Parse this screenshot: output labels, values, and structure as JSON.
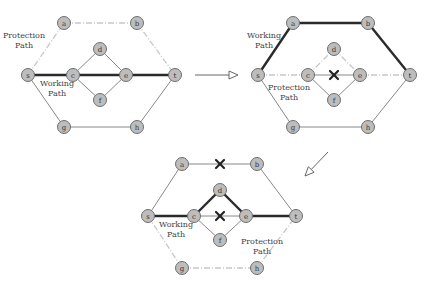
{
  "diagrams": [
    {
      "id": "initial",
      "nodes": [
        {
          "id": "a",
          "label": "a",
          "x": 64,
          "y": 23
        },
        {
          "id": "b",
          "label": "b",
          "x": 137,
          "y": 23
        },
        {
          "id": "s",
          "label": "s",
          "x": 28,
          "y": 75
        },
        {
          "id": "c",
          "label": "c",
          "x": 73,
          "y": 75
        },
        {
          "id": "d",
          "label": "d",
          "x": 100,
          "y": 49
        },
        {
          "id": "e",
          "label": "e",
          "x": 126,
          "y": 75
        },
        {
          "id": "f",
          "label": "f",
          "x": 100,
          "y": 100
        },
        {
          "id": "t",
          "label": "t",
          "x": 175,
          "y": 75
        },
        {
          "id": "g",
          "label": "g",
          "x": 64,
          "y": 127
        },
        {
          "id": "h",
          "label": "h",
          "x": 137,
          "y": 127
        }
      ],
      "edges": [
        {
          "from": "s",
          "to": "a",
          "type": "protect"
        },
        {
          "from": "a",
          "to": "b",
          "type": "protect"
        },
        {
          "from": "b",
          "to": "t",
          "type": "protect"
        },
        {
          "from": "s",
          "to": "c",
          "type": "working"
        },
        {
          "from": "c",
          "to": "e",
          "type": "working"
        },
        {
          "from": "e",
          "to": "t",
          "type": "working"
        },
        {
          "from": "c",
          "to": "d",
          "type": "normal"
        },
        {
          "from": "d",
          "to": "e",
          "type": "normal"
        },
        {
          "from": "c",
          "to": "f",
          "type": "normal"
        },
        {
          "from": "f",
          "to": "e",
          "type": "normal"
        },
        {
          "from": "s",
          "to": "g",
          "type": "normal"
        },
        {
          "from": "g",
          "to": "h",
          "type": "normal"
        },
        {
          "from": "h",
          "to": "t",
          "type": "normal"
        }
      ],
      "failures": [],
      "labels": [
        {
          "lines": [
            "Protection",
            "Path"
          ],
          "x": 24,
          "y": 38
        },
        {
          "lines": [
            "Working",
            "Path"
          ],
          "x": 57,
          "y": 86
        }
      ]
    },
    {
      "id": "after-first-failure",
      "nodes": [
        {
          "id": "a",
          "label": "a",
          "x": 293,
          "y": 23
        },
        {
          "id": "b",
          "label": "b",
          "x": 368,
          "y": 23
        },
        {
          "id": "s",
          "label": "s",
          "x": 258,
          "y": 75
        },
        {
          "id": "c",
          "label": "c",
          "x": 308,
          "y": 75
        },
        {
          "id": "d",
          "label": "d",
          "x": 334,
          "y": 49
        },
        {
          "id": "e",
          "label": "e",
          "x": 360,
          "y": 75
        },
        {
          "id": "f",
          "label": "f",
          "x": 334,
          "y": 100
        },
        {
          "id": "t",
          "label": "t",
          "x": 410,
          "y": 75
        },
        {
          "id": "g",
          "label": "g",
          "x": 293,
          "y": 127
        },
        {
          "id": "h",
          "label": "h",
          "x": 368,
          "y": 127
        }
      ],
      "edges": [
        {
          "from": "s",
          "to": "a",
          "type": "working"
        },
        {
          "from": "a",
          "to": "b",
          "type": "working"
        },
        {
          "from": "b",
          "to": "t",
          "type": "working"
        },
        {
          "from": "s",
          "to": "c",
          "type": "protect"
        },
        {
          "from": "c",
          "to": "e",
          "type": "normal"
        },
        {
          "from": "e",
          "to": "t",
          "type": "protect"
        },
        {
          "from": "c",
          "to": "d",
          "type": "protect"
        },
        {
          "from": "d",
          "to": "e",
          "type": "protect"
        },
        {
          "from": "c",
          "to": "f",
          "type": "normal"
        },
        {
          "from": "f",
          "to": "e",
          "type": "normal"
        },
        {
          "from": "s",
          "to": "g",
          "type": "normal"
        },
        {
          "from": "g",
          "to": "h",
          "type": "normal"
        },
        {
          "from": "h",
          "to": "t",
          "type": "normal"
        }
      ],
      "failures": [
        {
          "x": 334,
          "y": 75
        }
      ],
      "labels": [
        {
          "lines": [
            "Working",
            "Path"
          ],
          "x": 264,
          "y": 38
        },
        {
          "lines": [
            "Protection",
            "Path"
          ],
          "x": 289,
          "y": 90
        }
      ]
    },
    {
      "id": "after-second-failure",
      "nodes": [
        {
          "id": "a",
          "label": "a",
          "x": 182,
          "y": 164
        },
        {
          "id": "b",
          "label": "b",
          "x": 257,
          "y": 164
        },
        {
          "id": "s",
          "label": "s",
          "x": 148,
          "y": 216
        },
        {
          "id": "c",
          "label": "c",
          "x": 194,
          "y": 216
        },
        {
          "id": "d",
          "label": "d",
          "x": 220,
          "y": 190
        },
        {
          "id": "e",
          "label": "e",
          "x": 246,
          "y": 216
        },
        {
          "id": "f",
          "label": "f",
          "x": 220,
          "y": 240
        },
        {
          "id": "t",
          "label": "t",
          "x": 296,
          "y": 216
        },
        {
          "id": "g",
          "label": "g",
          "x": 182,
          "y": 268
        },
        {
          "id": "h",
          "label": "h",
          "x": 257,
          "y": 268
        }
      ],
      "edges": [
        {
          "from": "s",
          "to": "a",
          "type": "normal"
        },
        {
          "from": "a",
          "to": "b",
          "type": "normal"
        },
        {
          "from": "b",
          "to": "t",
          "type": "normal"
        },
        {
          "from": "s",
          "to": "c",
          "type": "working"
        },
        {
          "from": "c",
          "to": "d",
          "type": "working"
        },
        {
          "from": "d",
          "to": "e",
          "type": "working"
        },
        {
          "from": "e",
          "to": "t",
          "type": "working"
        },
        {
          "from": "c",
          "to": "e",
          "type": "normal"
        },
        {
          "from": "c",
          "to": "f",
          "type": "normal"
        },
        {
          "from": "f",
          "to": "e",
          "type": "normal"
        },
        {
          "from": "s",
          "to": "g",
          "type": "protect"
        },
        {
          "from": "g",
          "to": "h",
          "type": "protect"
        },
        {
          "from": "h",
          "to": "t",
          "type": "protect"
        }
      ],
      "failures": [
        {
          "x": 220,
          "y": 164
        },
        {
          "x": 220,
          "y": 216
        }
      ],
      "labels": [
        {
          "lines": [
            "Working",
            "Path"
          ],
          "x": 176,
          "y": 227
        },
        {
          "lines": [
            "Protection",
            "Path"
          ],
          "x": 262,
          "y": 244
        }
      ]
    }
  ],
  "arrows": [
    {
      "x1": 195,
      "y1": 75,
      "x2": 238,
      "y2": 75
    },
    {
      "x1": 328,
      "y1": 152,
      "x2": 305,
      "y2": 176
    }
  ]
}
